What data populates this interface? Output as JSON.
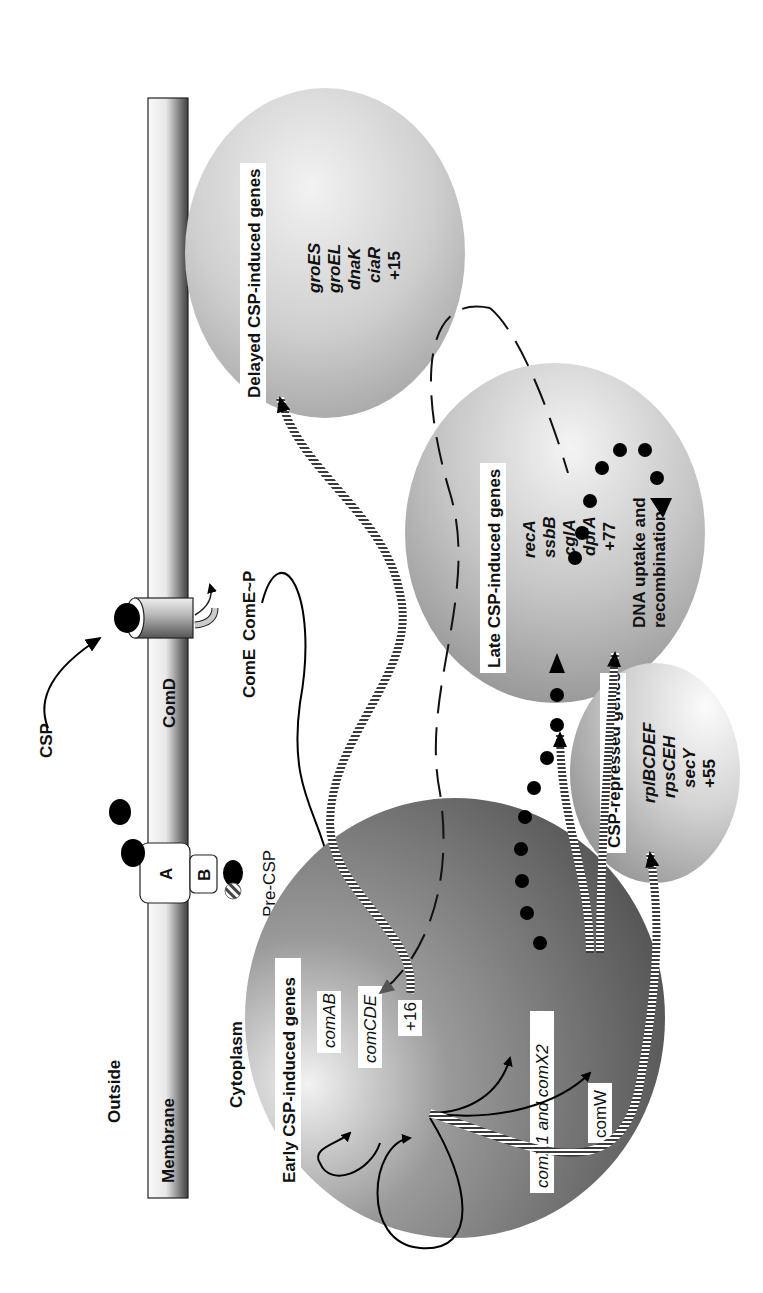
{
  "figure": {
    "orientation": "rotated-90-ccw",
    "compartments": {
      "outside": "Outside",
      "membrane": "Membrane",
      "cytoplasm": "Cytoplasm"
    },
    "proteins": {
      "transporter_a": "A",
      "transporter_b": "B",
      "histidine_kinase": "ComD",
      "response_regulator": "ComE",
      "phospho_regulator": "ComE~P"
    },
    "signals": {
      "csp": "CSP",
      "pre_csp": "Pre-CSP"
    },
    "groups": {
      "early": {
        "title": "Early CSP-induced genes",
        "genes": [
          "comAB",
          "comCDE",
          "+16",
          "comX1 and comX2",
          "comW"
        ]
      },
      "late": {
        "title": "Late CSP-induced genes",
        "genes": [
          "recA",
          "ssbB",
          "cglA",
          "dprA",
          "+77"
        ],
        "outcome_line1": "DNA uptake and",
        "outcome_line2": "recombination"
      },
      "delayed": {
        "title": "Delayed CSP-induced genes",
        "genes": [
          "groES",
          "groEL",
          "dnaK",
          "ciaR",
          "+15"
        ]
      },
      "repressed": {
        "title": "CSP-repressed genes",
        "genes": [
          "rplBCDEF",
          "rpsCEH",
          "secY",
          "+55"
        ]
      }
    },
    "colors": {
      "membrane_light": "#f4f4f4",
      "membrane_dark": "#4a4a4a",
      "early_dark": "#5a5a5a",
      "late_mid": "#9a9a9a",
      "delayed_mid": "#b0b0b0",
      "repressed_mid": "#a8a8a8"
    }
  }
}
